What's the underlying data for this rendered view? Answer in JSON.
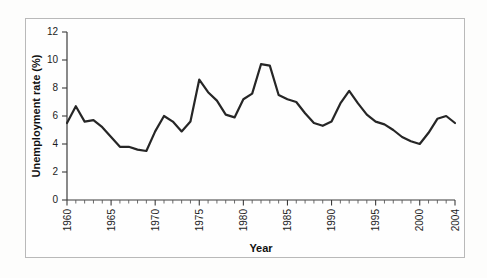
{
  "figure": {
    "background_color": "#fdfdfc",
    "frame_color": "#b9b9b9",
    "line_color": "#262626"
  },
  "axes": {
    "y_title": "Unemployment rate (%)",
    "x_title": "Year",
    "y_ticks": [
      "0",
      "2",
      "4",
      "6",
      "8",
      "10",
      "12"
    ],
    "x_ticks": [
      "1960",
      "1965",
      "1970",
      "1975",
      "1980",
      "1985",
      "1990",
      "1995",
      "2000",
      "2004"
    ]
  },
  "chart_data": {
    "type": "line",
    "title": "",
    "xlabel": "Year",
    "ylabel": "Unemployment rate (%)",
    "xlim": [
      1960,
      2004
    ],
    "ylim": [
      0,
      12
    ],
    "grid": false,
    "legend": "none",
    "x": [
      1960,
      1961,
      1962,
      1963,
      1964,
      1965,
      1966,
      1967,
      1968,
      1969,
      1970,
      1971,
      1972,
      1973,
      1974,
      1975,
      1976,
      1977,
      1978,
      1979,
      1980,
      1981,
      1982,
      1983,
      1984,
      1985,
      1986,
      1987,
      1988,
      1989,
      1990,
      1991,
      1992,
      1993,
      1994,
      1995,
      1996,
      1997,
      1998,
      1999,
      2000,
      2001,
      2002,
      2003,
      2004
    ],
    "values": [
      5.5,
      6.7,
      5.6,
      5.7,
      5.2,
      4.5,
      3.8,
      3.8,
      3.6,
      3.5,
      4.9,
      6.0,
      5.6,
      4.9,
      5.6,
      8.6,
      7.7,
      7.1,
      6.1,
      5.9,
      7.2,
      7.6,
      9.7,
      9.6,
      7.5,
      7.2,
      7.0,
      6.2,
      5.5,
      5.3,
      5.6,
      6.9,
      7.8,
      6.9,
      6.1,
      5.6,
      5.4,
      5.0,
      4.5,
      4.2,
      4.0,
      4.8,
      5.8,
      6.0,
      5.5
    ],
    "series": [
      {
        "name": "Unemployment rate",
        "values": [
          5.5,
          6.7,
          5.6,
          5.7,
          5.2,
          4.5,
          3.8,
          3.8,
          3.6,
          3.5,
          4.9,
          6.0,
          5.6,
          4.9,
          5.6,
          8.6,
          7.7,
          7.1,
          6.1,
          5.9,
          7.2,
          7.6,
          9.7,
          9.6,
          7.5,
          7.2,
          7.0,
          6.2,
          5.5,
          5.3,
          5.6,
          6.9,
          7.8,
          6.9,
          6.1,
          5.6,
          5.4,
          5.0,
          4.5,
          4.2,
          4.0,
          4.8,
          5.8,
          6.0,
          5.5
        ]
      }
    ]
  }
}
